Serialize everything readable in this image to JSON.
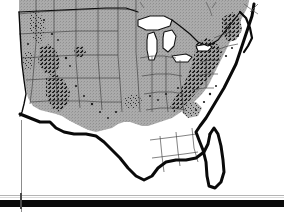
{
  "figure": {
    "kind": "scanned-map-figure",
    "background_color": "#ffffff"
  },
  "map": {
    "projection_hint": "conic",
    "colors": {
      "land_shaded": "#a9a9a9",
      "land_unshaded": "#ffffff",
      "water": "#ffffff",
      "state_border": "#3c3c3c",
      "national_border": "#111111",
      "coastline_heavy": "#0a0a0a",
      "stipple": "#1c1c1c",
      "paper": "#ffffff"
    },
    "regions": [
      {
        "id": "shaded-interior",
        "label": "Shaded states",
        "fill": "#a9a9a9"
      },
      {
        "id": "great-lakes",
        "label": "Great Lakes",
        "fill": "#ffffff"
      },
      {
        "id": "texas-gulf",
        "label": "Texas and Gulf Coast",
        "fill": "#ffffff"
      },
      {
        "id": "florida-southeast",
        "label": "Florida and Southeast",
        "fill": "#ffffff"
      }
    ],
    "stipple_zones": [
      {
        "id": "northern-rockies",
        "label": "Northern Rocky Mountains"
      },
      {
        "id": "central-rockies",
        "label": "Central Rocky Mountains"
      },
      {
        "id": "southern-rockies",
        "label": "Southern Rocky Mountains"
      },
      {
        "id": "appalachians",
        "label": "Appalachian Mountains"
      },
      {
        "id": "northeast-highlands",
        "label": "Northeast Highlands"
      },
      {
        "id": "piedmont",
        "label": "Piedmont"
      }
    ]
  },
  "page_artifacts": {
    "hairline_label": "page hairline rule",
    "bar_label": "page footer bar",
    "left_rule_label": "page left margin rule",
    "tick_label": "page registration tick"
  }
}
